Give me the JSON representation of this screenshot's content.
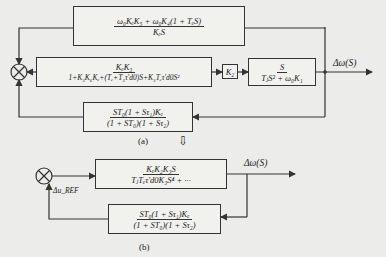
{
  "diagram_a": {
    "caption": "(a)",
    "block_top": {
      "num": "ω₀KₑK₅ + ω₀K₄(1 + TₑS)",
      "den": "KₑS"
    },
    "block_main": {
      "num": "KₑK₃",
      "den": "1+K₃K₆Kₑ+(Tₑ+T₃τ′d0)S+K₃Tₑτ′d0S²"
    },
    "block_k2": {
      "label": "K₂"
    },
    "block_plant": {
      "num": "S",
      "den": "TⱼS² + ω₀K₁"
    },
    "block_feedback": {
      "num": "ST₀(1 + Sτ₁)Kₑ",
      "den": "(1 + ST₀)(1 + Sτ₂)"
    },
    "output_label": "Δω(S)"
  },
  "transform_arrow": "⇩",
  "diagram_b": {
    "caption": "(b)",
    "block_forward": {
      "num": "KₑK₂K₃S",
      "den": "TⱼTₑτ′d0K₃S⁴ + ···"
    },
    "block_feedback": {
      "num": "ST₀(1 + Sτ₁)Kₑ",
      "den": "(1 + ST₀)(1 + Sτ₂)"
    },
    "output_label": "Δω(S)",
    "input_label": "Δu_REF"
  }
}
